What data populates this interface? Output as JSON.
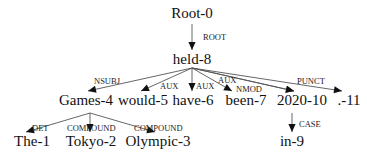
{
  "diagram": {
    "type": "dependency-parse-tree",
    "nodes": [
      {
        "id": "root",
        "label": "Root-0",
        "x": 192,
        "y": 18
      },
      {
        "id": "held",
        "label": "held-8",
        "x": 192,
        "y": 64
      },
      {
        "id": "games",
        "label": "Games-4",
        "x": 86,
        "y": 105
      },
      {
        "id": "would",
        "label": "would-5",
        "x": 143,
        "y": 105
      },
      {
        "id": "have",
        "label": "have-6",
        "x": 193,
        "y": 105
      },
      {
        "id": "been",
        "label": "been-7",
        "x": 246,
        "y": 105
      },
      {
        "id": "y2020",
        "label": "2020-10",
        "x": 302,
        "y": 105
      },
      {
        "id": "punct",
        "label": ".-11",
        "x": 349,
        "y": 105
      },
      {
        "id": "the",
        "label": "The-1",
        "x": 32,
        "y": 146
      },
      {
        "id": "tokyo",
        "label": "Tokyo-2",
        "x": 91,
        "y": 146
      },
      {
        "id": "olympic",
        "label": "Olympic-3",
        "x": 158,
        "y": 146
      },
      {
        "id": "in",
        "label": "in-9",
        "x": 292,
        "y": 146
      }
    ],
    "edges": [
      {
        "from": "root",
        "to": "held",
        "label": "ROOT",
        "x1": 192,
        "y1": 24,
        "x2": 192,
        "y2": 50,
        "lx": 203,
        "ly": 40
      },
      {
        "from": "held",
        "to": "games",
        "label": "NSUBJ",
        "x1": 192,
        "y1": 68,
        "x2": 88,
        "y2": 91,
        "lx": 94,
        "ly": 84
      },
      {
        "from": "held",
        "to": "would",
        "label": "AUX",
        "x1": 192,
        "y1": 68,
        "x2": 141,
        "y2": 91,
        "lx": 160,
        "ly": 89
      },
      {
        "from": "held",
        "to": "have",
        "label": "AUX",
        "x1": 192,
        "y1": 68,
        "x2": 192,
        "y2": 91,
        "lx": 196,
        "ly": 89
      },
      {
        "from": "held",
        "to": "been",
        "label": "AUX",
        "x1": 192,
        "y1": 68,
        "x2": 232,
        "y2": 91,
        "lx": 218,
        "ly": 83
      },
      {
        "from": "held",
        "to": "been",
        "label": "NMOD",
        "x1": 192,
        "y1": 68,
        "x2": 294,
        "y2": 91,
        "lx": 236,
        "ly": 92
      },
      {
        "from": "held",
        "to": "y2020",
        "label": "",
        "x1": 192,
        "y1": 68,
        "x2": 294,
        "y2": 91,
        "lx": 0,
        "ly": 0
      },
      {
        "from": "held",
        "to": "punct",
        "label": "PUNCT",
        "x1": 192,
        "y1": 68,
        "x2": 342,
        "y2": 91,
        "lx": 297,
        "ly": 84
      },
      {
        "from": "games",
        "to": "the",
        "label": "DET",
        "x1": 90,
        "y1": 113,
        "x2": 26,
        "y2": 132,
        "lx": 32,
        "ly": 131
      },
      {
        "from": "games",
        "to": "tokyo",
        "label": "COMPOUND",
        "x1": 90,
        "y1": 113,
        "x2": 90,
        "y2": 132,
        "lx": 67,
        "ly": 131
      },
      {
        "from": "games",
        "to": "olympic",
        "label": "COMPOUND",
        "x1": 90,
        "y1": 113,
        "x2": 155,
        "y2": 132,
        "lx": 134,
        "ly": 131
      },
      {
        "from": "y2020",
        "to": "in",
        "label": "CASE",
        "x1": 292,
        "y1": 113,
        "x2": 292,
        "y2": 132,
        "lx": 299,
        "ly": 127
      }
    ]
  }
}
